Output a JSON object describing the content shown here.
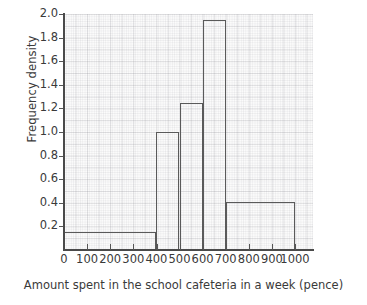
{
  "chart_data": {
    "type": "bar",
    "subtype": "histogram",
    "title": "",
    "xlabel": "Amount spent in the school cafeteria in a week (pence)",
    "ylabel": "Frequency density",
    "xlim": [
      0,
      1000
    ],
    "ylim": [
      0,
      2.0
    ],
    "grid": true,
    "legend": null,
    "x_ticks": [
      0,
      100,
      200,
      300,
      400,
      500,
      600,
      700,
      800,
      900,
      1000
    ],
    "x_tick_labels": [
      "0",
      "100",
      "200",
      "300",
      "400",
      "500",
      "600",
      "700",
      "800",
      "900",
      "1000"
    ],
    "y_ticks": [
      0.2,
      0.4,
      0.6,
      0.8,
      1.0,
      1.2,
      1.4,
      1.6,
      1.8,
      2.0
    ],
    "y_tick_labels": [
      "0.2",
      "0.4",
      "0.6",
      "0.8",
      "1.0",
      "1.2",
      "1.4",
      "1.6",
      "1.8",
      "2.0"
    ],
    "bin_edges": [
      0,
      400,
      500,
      600,
      700,
      1000
    ],
    "categories": [
      "0-400",
      "400-500",
      "500-600",
      "600-700",
      "700-1000"
    ],
    "values": [
      0.15,
      1.0,
      1.25,
      1.95,
      0.41
    ],
    "bars": [
      {
        "label": "0-400",
        "start": 0,
        "end": 400,
        "density": 0.15
      },
      {
        "label": "400-500",
        "start": 400,
        "end": 500,
        "density": 1.0
      },
      {
        "label": "500-600",
        "start": 500,
        "end": 600,
        "density": 1.25
      },
      {
        "label": "600-700",
        "start": 600,
        "end": 700,
        "density": 1.95
      },
      {
        "label": "700-1000",
        "start": 700,
        "end": 1000,
        "density": 0.41
      }
    ],
    "colors": {
      "bar_outline": "#5a5a5a",
      "bar_fill": "transparent",
      "axis": "#4a4a4a",
      "grid": "#787882",
      "plot_background": "#fbfbfb",
      "text": "#3a3a3a"
    }
  }
}
